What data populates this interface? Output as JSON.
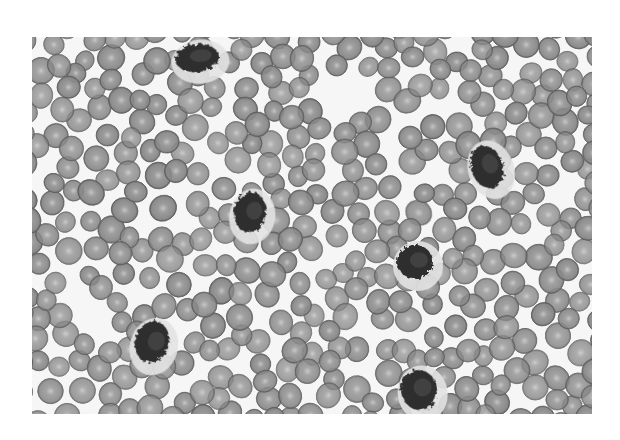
{
  "image": {
    "subject": "blood smear micrograph (grayscale)",
    "frame": {
      "x": 32,
      "y": 37,
      "width": 560,
      "height": 377
    },
    "page_background": "#ffffff",
    "field_background": "#f6f6f6",
    "rbc_fill": "#8a8a8a",
    "rbc_edge": "#5e5e5e",
    "rbc_center": "#c4c4c4",
    "wbc_fill": "#2e2e2e",
    "wbc_halo": "#e2e2e2",
    "rbc_radius": 12,
    "leukocytes": [
      {
        "cx": 165,
        "cy": 21,
        "rx": 22,
        "ry": 14,
        "rot": -5
      },
      {
        "cx": 455,
        "cy": 130,
        "rx": 16,
        "ry": 22,
        "rot": -20
      },
      {
        "cx": 218,
        "cy": 175,
        "rx": 16,
        "ry": 20,
        "rot": 10
      },
      {
        "cx": 383,
        "cy": 225,
        "rx": 18,
        "ry": 17,
        "rot": 0
      },
      {
        "cx": 120,
        "cy": 305,
        "rx": 17,
        "ry": 21,
        "rot": 15
      },
      {
        "cx": 387,
        "cy": 353,
        "rx": 18,
        "ry": 20,
        "rot": -10
      }
    ]
  }
}
